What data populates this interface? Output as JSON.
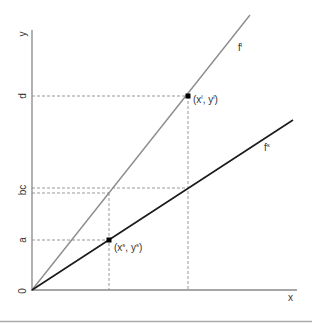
{
  "diagram": {
    "axes": {
      "x_label": "x",
      "y_label": "y",
      "origin_label": "0",
      "axis_color": "#888888"
    },
    "y_ticks": [
      {
        "label": "d",
        "name": "tick-d"
      },
      {
        "label": "bc",
        "name": "tick-bc"
      },
      {
        "label": "a",
        "name": "tick-a"
      }
    ],
    "curves": [
      {
        "name": "f-l",
        "base": "f",
        "sup": "l",
        "color": "#8c8c8c"
      },
      {
        "name": "f-s",
        "base": "f",
        "sup": "s",
        "color": "#1a1a1a"
      }
    ],
    "points": [
      {
        "name": "point-l",
        "text_open": "(x",
        "sup1": "l",
        "text_mid": ", y",
        "sup2": "l",
        "text_close": ")"
      },
      {
        "name": "point-s",
        "text_open": "(x",
        "sup1": "s",
        "text_mid": ", y",
        "sup2": "s",
        "text_close": ")"
      }
    ],
    "guide_color": "#999999",
    "footer_rule_color": "#aaaaaa"
  }
}
